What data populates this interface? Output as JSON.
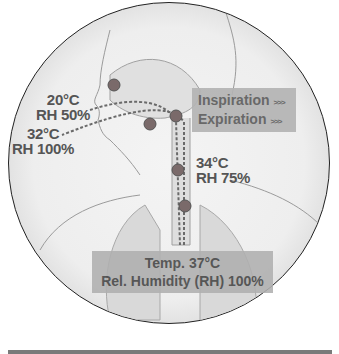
{
  "diagram": {
    "labels": {
      "ambient": {
        "temp": "20°C",
        "rh": "RH 50%"
      },
      "exhaled": {
        "temp": "32°C",
        "rh": "RH 100%"
      },
      "trachea": {
        "temp": "34°C",
        "rh": "RH 75%"
      },
      "alveolar": {
        "temp": "Temp. 37°C",
        "rh": "Rel. Humidity (RH) 100%"
      }
    },
    "legend": {
      "items": [
        {
          "label": "Inspiration",
          "arrow": ">>>"
        },
        {
          "label": "Expiration",
          "arrow": ">>>"
        }
      ]
    },
    "colors": {
      "background": "#eeeeee",
      "label_text": "#555555",
      "legend_box": "#b3b3b3",
      "organ_dot": "#7a6a6a",
      "outline": "#999999"
    }
  }
}
